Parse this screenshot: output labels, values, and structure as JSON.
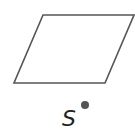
{
  "diagram": {
    "shape": {
      "type": "parallelogram",
      "points": [
        [
          43,
          15
        ],
        [
          134,
          15
        ],
        [
          105,
          83
        ],
        [
          14,
          83
        ]
      ],
      "stroke": "#555555",
      "stroke_width": 1.6,
      "fill": "none"
    },
    "point": {
      "label": "S",
      "cx": 85,
      "cy": 105,
      "r": 4,
      "color": "#555555"
    },
    "label_position": {
      "x": 62,
      "y": 126
    }
  }
}
